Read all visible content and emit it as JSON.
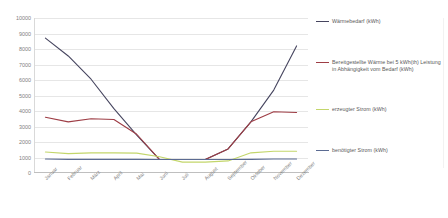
{
  "chart_data": {
    "type": "line",
    "title": "",
    "xlabel": "",
    "ylabel": "",
    "ylim": [
      0,
      10000
    ],
    "ytick_step": 1000,
    "grid": true,
    "legend_position": "right",
    "categories": [
      "Januar",
      "Februar",
      "März",
      "April",
      "Mai",
      "Juni",
      "Juli",
      "August",
      "September",
      "Oktober",
      "November",
      "Dezember"
    ],
    "yticks": [
      "0",
      "1000",
      "2000",
      "3000",
      "4000",
      "5000",
      "6000",
      "7000",
      "8000",
      "9000",
      "10000"
    ],
    "series": [
      {
        "name": "Wärmebedarf (kWh)",
        "color": "#46455f",
        "values": [
          8700,
          7550,
          6050,
          4150,
          2450,
          870,
          870,
          870,
          1550,
          3300,
          5350,
          8200
        ]
      },
      {
        "name": "Bereitgestellte Wärme bei 5 kWh(th) Leistung in Abhängigkeit vom Bedarf (kWh)",
        "color": "#9e3d45",
        "values": [
          3600,
          3300,
          3500,
          3450,
          2500,
          870,
          870,
          870,
          1550,
          3300,
          3950,
          3900
        ]
      },
      {
        "name": "erzeugter Strom (kWh)",
        "color": "#c3d66b",
        "values": [
          1350,
          1250,
          1300,
          1300,
          1280,
          1050,
          700,
          700,
          780,
          1300,
          1400,
          1400
        ]
      },
      {
        "name": "benötigter Strom (kWh)",
        "color": "#5b6b92",
        "values": [
          900,
          880,
          880,
          880,
          880,
          870,
          870,
          870,
          870,
          880,
          900,
          900
        ]
      }
    ]
  },
  "legend": {
    "items": [
      {
        "label": "Wärmebedarf (kWh)",
        "color": "#46455f"
      },
      {
        "label": "Bereitgestellte Wärme bei 5 kWh(th) Leistung in Abhängigkeit vom Bedarf (kWh)",
        "color": "#9e3d45"
      },
      {
        "label": "erzeugter Strom (kWh)",
        "color": "#c3d66b"
      },
      {
        "label": "benötigter Strom (kWh)",
        "color": "#5b6b92"
      }
    ]
  }
}
